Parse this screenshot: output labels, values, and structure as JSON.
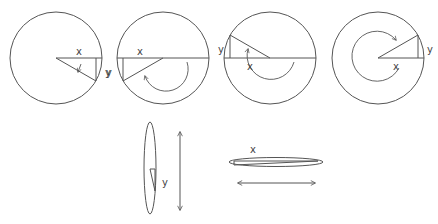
{
  "diagram": {
    "colors": {
      "stroke": "#555555",
      "text": "#444444",
      "background": "#ffffff"
    },
    "circles": [
      {
        "id": "circle-1",
        "x_label": "x",
        "y_label": "y",
        "quadrant": "fourth",
        "rotation": "small clockwise arrow"
      },
      {
        "id": "circle-2",
        "x_label": "x",
        "y_label": "y",
        "quadrant": "third",
        "rotation": "half-turn arrow"
      },
      {
        "id": "circle-3",
        "x_label": "x",
        "y_label": "y",
        "quadrant": "second",
        "rotation": "three-quarter-turn arrow"
      },
      {
        "id": "circle-4",
        "x_label": "x",
        "y_label": "y",
        "quadrant": "first",
        "rotation": "near full-turn arrow"
      }
    ],
    "edge_views": [
      {
        "id": "vertical-edge-view",
        "label": "y",
        "arrow": "vertical double-headed"
      },
      {
        "id": "horizontal-edge-view",
        "label": "x",
        "arrow": "horizontal double-headed"
      }
    ]
  }
}
